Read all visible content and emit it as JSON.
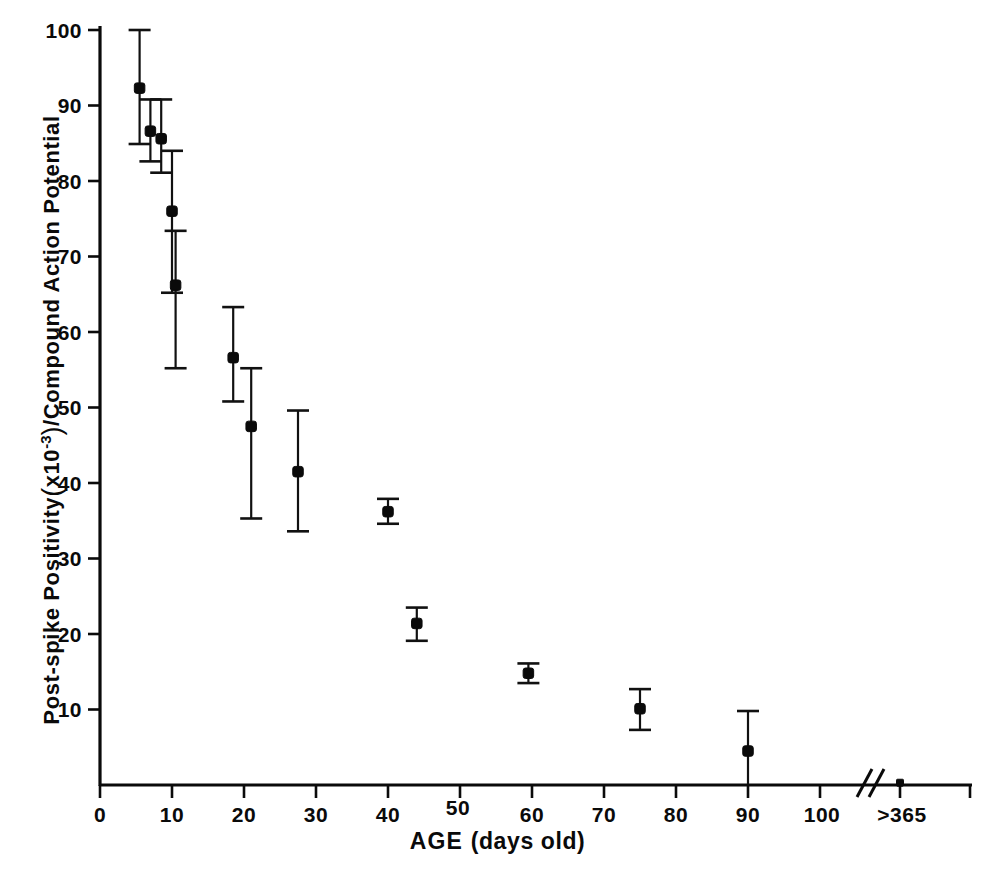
{
  "figure": {
    "background_color": "#ffffff",
    "ink_color": "#0a0a0a"
  },
  "axes": {
    "x_title_main": "AGE",
    "x_title_unit": "(days old)",
    "y_title_part1": "Post-spike Positivity",
    "y_title_open_paren": "(",
    "y_title_mantissa": "x10",
    "y_title_exponent": "-3",
    "y_title_close_paren": ")",
    "y_title_part2": "/Compound Action Potential",
    "x_tick_labels": [
      "0",
      "10",
      "20",
      "30",
      "40",
      "50",
      "60",
      "70",
      "80",
      "90",
      "100",
      ">365"
    ],
    "y_tick_labels": [
      "0",
      "10",
      "20",
      "30",
      "40",
      "50",
      "60",
      "70",
      "80",
      "90",
      "100"
    ],
    "break_symbol": "//"
  },
  "chart_data": {
    "type": "scatter",
    "title": "",
    "xlabel": "AGE (days old)",
    "ylabel": "Post-spike Positivity (x10^-3) / Compound Action Potential",
    "xlim": [
      0,
      110
    ],
    "ylim": [
      0,
      100
    ],
    "xticks": [
      0,
      10,
      20,
      30,
      40,
      50,
      60,
      70,
      80,
      90,
      100
    ],
    "yticks": [
      0,
      10,
      20,
      30,
      40,
      50,
      60,
      70,
      80,
      90,
      100
    ],
    "grid": false,
    "legend": "none",
    "axis_break": {
      "present": true,
      "after_x": 103,
      "label_after_break": ">365"
    },
    "error_bars": "vertical, symmetric-ish, with caps",
    "x": [
      5.5,
      7,
      8.5,
      10,
      10.5,
      18.5,
      21,
      27.5,
      40,
      44,
      59.5,
      75,
      90,
      365
    ],
    "y": [
      92.3,
      86.6,
      85.6,
      76.0,
      66.2,
      56.6,
      47.5,
      41.5,
      36.2,
      21.4,
      14.8,
      10.1,
      4.5,
      0.3
    ],
    "y_err_low": [
      7.4,
      4.0,
      4.5,
      10.8,
      11.0,
      5.8,
      12.2,
      7.9,
      1.6,
      2.3,
      1.3,
      2.8,
      4.4,
      0.0
    ],
    "y_err_high": [
      7.7,
      4.2,
      5.2,
      8.0,
      7.2,
      6.7,
      7.7,
      8.1,
      1.7,
      2.1,
      1.3,
      2.6,
      5.3,
      0.0
    ],
    "points": [
      {
        "x": 5.5,
        "y": 92.3,
        "low": 84.9,
        "high": 100.0
      },
      {
        "x": 7.0,
        "y": 86.6,
        "low": 82.6,
        "high": 90.8
      },
      {
        "x": 8.5,
        "y": 85.6,
        "low": 81.1,
        "high": 90.8
      },
      {
        "x": 10.0,
        "y": 76.0,
        "low": 65.2,
        "high": 84.0
      },
      {
        "x": 10.5,
        "y": 66.2,
        "low": 55.2,
        "high": 73.4
      },
      {
        "x": 18.5,
        "y": 56.6,
        "low": 50.8,
        "high": 63.3
      },
      {
        "x": 21.0,
        "y": 47.5,
        "low": 35.3,
        "high": 55.2
      },
      {
        "x": 27.5,
        "y": 41.5,
        "low": 33.6,
        "high": 49.6
      },
      {
        "x": 40.0,
        "y": 36.2,
        "low": 34.6,
        "high": 37.9
      },
      {
        "x": 44.0,
        "y": 21.4,
        "low": 19.1,
        "high": 23.5
      },
      {
        "x": 59.5,
        "y": 14.8,
        "low": 13.5,
        "high": 16.1
      },
      {
        "x": 75.0,
        "y": 10.1,
        "low": 7.3,
        "high": 12.7
      },
      {
        "x": 90.0,
        "y": 4.5,
        "low": 0.1,
        "high": 9.8
      },
      {
        "x": 365,
        "y": 0.3,
        "low": 0.3,
        "high": 0.3
      }
    ]
  }
}
